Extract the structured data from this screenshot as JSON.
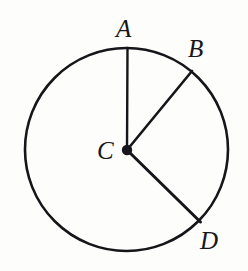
{
  "figure": {
    "kind": "geometry-diagram",
    "background_color": "#fdfdfc",
    "stroke_color": "#16161a",
    "circle": {
      "center_x": 126.5,
      "center_y": 149.5,
      "radius": 101.5,
      "stroke_width": 2.6
    },
    "center_dot": {
      "x": 127,
      "y": 150,
      "radius": 5.2,
      "fill": "#16161a"
    },
    "radii": [
      {
        "name": "CA",
        "from": "C",
        "to": "A",
        "x1": 127,
        "y1": 150,
        "x2": 127.5,
        "y2": 48,
        "angle_deg": 90,
        "stroke_width": 2.4
      },
      {
        "name": "CB",
        "from": "C",
        "to": "B",
        "x1": 127,
        "y1": 150,
        "x2": 192,
        "y2": 71,
        "angle_deg": 50,
        "stroke_width": 2.6
      },
      {
        "name": "CD",
        "from": "C",
        "to": "D",
        "x1": 127,
        "y1": 150,
        "x2": 200.5,
        "y2": 222,
        "angle_deg": -44,
        "stroke_width": 3.0
      }
    ],
    "labels": [
      {
        "id": "A",
        "text": "A",
        "x": 116,
        "y": 16,
        "anchor_point": "top of circle"
      },
      {
        "id": "B",
        "text": "B",
        "x": 188,
        "y": 36,
        "anchor_point": "upper right of circle"
      },
      {
        "id": "C",
        "text": "C",
        "x": 97,
        "y": 138,
        "anchor_point": "center of circle"
      },
      {
        "id": "D",
        "text": "D",
        "x": 200,
        "y": 228,
        "anchor_point": "lower right of circle"
      }
    ]
  }
}
